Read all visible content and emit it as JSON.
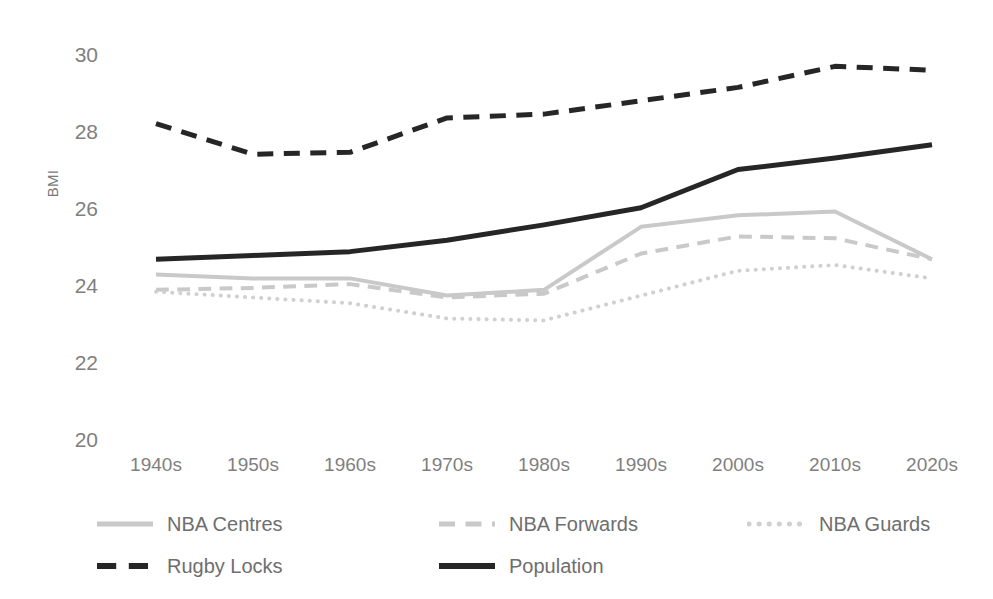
{
  "chart_data": {
    "type": "line",
    "title": "",
    "xlabel": "",
    "ylabel": "BMI",
    "categories": [
      "1940s",
      "1950s",
      "1960s",
      "1970s",
      "1980s",
      "1990s",
      "2000s",
      "2010s",
      "2020s"
    ],
    "ylim": [
      20,
      30
    ],
    "yticks": [
      20,
      22,
      24,
      26,
      28,
      30
    ],
    "grid": false,
    "legend_position": "bottom",
    "series": [
      {
        "name": "NBA Centres",
        "style": "solid",
        "color": "#C9C9C9",
        "values": [
          24.2,
          24.1,
          24.1,
          23.65,
          23.8,
          25.45,
          25.75,
          25.85,
          24.6
        ]
      },
      {
        "name": "NBA Forwards",
        "style": "dashed",
        "color": "#C9C9C9",
        "values": [
          23.8,
          23.85,
          23.95,
          23.6,
          23.7,
          24.75,
          25.2,
          25.15,
          24.6
        ]
      },
      {
        "name": "NBA Guards",
        "style": "dotted",
        "color": "#D0D0D0",
        "values": [
          23.75,
          23.6,
          23.45,
          23.05,
          23.0,
          23.65,
          24.3,
          24.45,
          24.1
        ]
      },
      {
        "name": "Rugby Locks",
        "style": "dashed",
        "color": "#262626",
        "values": [
          28.15,
          27.35,
          27.4,
          28.3,
          28.4,
          28.75,
          29.1,
          29.65,
          29.55
        ]
      },
      {
        "name": "Population",
        "style": "solid",
        "color": "#262626",
        "values": [
          24.6,
          24.7,
          24.8,
          25.1,
          25.5,
          25.95,
          26.95,
          27.25,
          27.6
        ]
      }
    ]
  },
  "axis": {
    "y_title": "BMI",
    "y_ticks": [
      "30",
      "28",
      "26",
      "24",
      "22",
      "20"
    ],
    "x_ticks": [
      "1940s",
      "1950s",
      "1960s",
      "1970s",
      "1980s",
      "1990s",
      "2000s",
      "2010s",
      "2020s"
    ]
  },
  "legend": {
    "rows": [
      [
        {
          "label": "NBA Centres",
          "style": "solid",
          "color": "#C9C9C9"
        },
        {
          "label": "NBA Forwards",
          "style": "dashed",
          "color": "#C9C9C9"
        },
        {
          "label": "NBA Guards",
          "style": "dotted",
          "color": "#D0D0D0"
        }
      ],
      [
        {
          "label": "Rugby Locks",
          "style": "dashed",
          "color": "#262626"
        },
        {
          "label": "Population",
          "style": "solid",
          "color": "#262626"
        }
      ]
    ]
  }
}
